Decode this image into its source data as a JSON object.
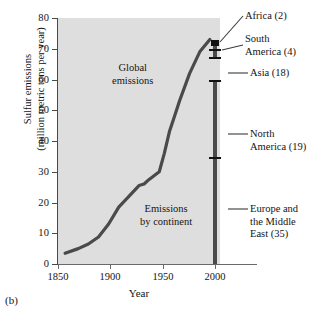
{
  "panel": {
    "letter": "(b)"
  },
  "chart_data": {
    "type": "line",
    "title": "",
    "xlabel": "Year",
    "ylabel": "Sulfur emissions (million metric tons per year)",
    "ylabel_line1": "Sulfur emissions",
    "ylabel_line2": "(million metric tons per year)",
    "xlim": [
      1850,
      2010
    ],
    "ylim": [
      0,
      80
    ],
    "grid": false,
    "legend": "none",
    "background": "#dedede",
    "series_color": "#4a4a4a",
    "xticks": [
      1850,
      1900,
      1950,
      2000
    ],
    "xtick_labels": [
      "1850",
      "1900",
      "1950",
      "2000"
    ],
    "yticks": [
      0,
      10,
      20,
      30,
      40,
      50,
      60,
      70,
      80
    ],
    "ytick_labels": [
      "0",
      "10",
      "20",
      "30",
      "40",
      "50",
      "60",
      "70",
      "80"
    ],
    "series": [
      {
        "name": "Global emissions",
        "x": [
          1857,
          1870,
          1880,
          1890,
          1900,
          1910,
          1920,
          1930,
          1935,
          1940,
          1950,
          1955,
          1960,
          1965,
          1970,
          1980,
          1990,
          2000
        ],
        "y": [
          3.5,
          5.0,
          6.5,
          8.8,
          13.0,
          18.5,
          22.0,
          25.5,
          26.0,
          27.5,
          30.0,
          36.0,
          43.0,
          48.0,
          53.0,
          62.0,
          69.0,
          73.0
        ]
      }
    ],
    "annotations": [
      {
        "name": "global-emissions",
        "text_line1": "Global",
        "text_line2": "emissions"
      },
      {
        "name": "emissions-by-continent",
        "text_line1": "Emissions",
        "text_line2": "by continent"
      }
    ],
    "stacked_bar": {
      "name": "Emissions by continent",
      "year": 2000,
      "total": 78,
      "unit": "million metric tons per year",
      "segments": [
        {
          "label": "Africa (2)",
          "name": "Africa",
          "value": 2,
          "label_line1": "Africa (2)",
          "label_line2": ""
        },
        {
          "label": "South America (4)",
          "name": "South America",
          "value": 4,
          "label_line1": "South",
          "label_line2": "America (4)"
        },
        {
          "label": "Asia (18)",
          "name": "Asia",
          "value": 18,
          "label_line1": "Asia (18)",
          "label_line2": ""
        },
        {
          "label": "North America (19)",
          "name": "North America",
          "value": 19,
          "label_line1": "North",
          "label_line2": "America (19)"
        },
        {
          "label": "Europe and the Middle East (35)",
          "name": "Europe and the Middle East",
          "value": 35,
          "label_line1": "Europe and",
          "label_line2": "the Middle",
          "label_line3": "East (35)"
        }
      ]
    }
  }
}
